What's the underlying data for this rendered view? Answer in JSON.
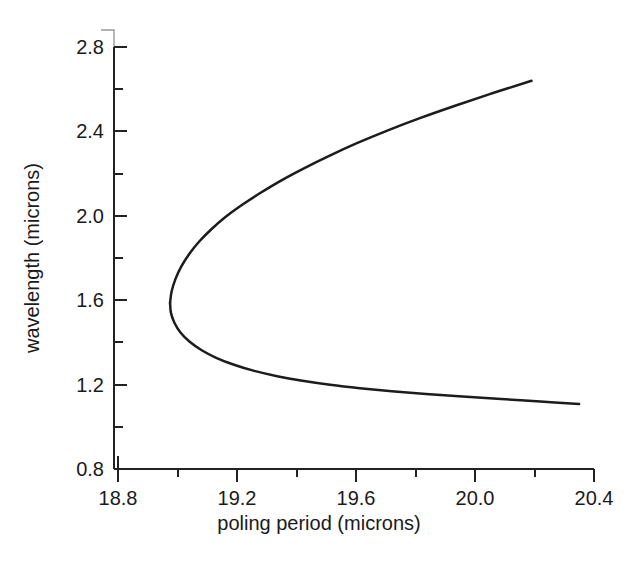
{
  "chart_data": {
    "type": "line",
    "title": "",
    "subtitle": "",
    "xlabel": "poling period (microns)",
    "ylabel": "wavelength (microns)",
    "xlim": [
      18.8,
      20.4
    ],
    "ylim": [
      0.8,
      2.8
    ],
    "xticks": [
      "18.8",
      "19.2",
      "19.6",
      "20.0",
      "20.4"
    ],
    "xtick_values": [
      18.8,
      19.2,
      19.6,
      20.0,
      20.4
    ],
    "xminor_step": 0.2,
    "yticks": [
      "2.8",
      "2.4",
      "2.0",
      "1.6",
      "1.2",
      "0.8"
    ],
    "ytick_values": [
      2.8,
      2.4,
      2.0,
      1.6,
      1.2,
      0.8
    ],
    "yminor_step": 0.2,
    "grid": false,
    "legend": "none",
    "tick_direction": "in",
    "axes_visible": [
      "left",
      "bottom"
    ],
    "line_color": "#1c1c1c",
    "background_color": "#ffffff",
    "series": [
      {
        "name": "signal branch (upper)",
        "comment": "upper branch: wavelength increases with poling period",
        "points": [
          [
            18.975,
            1.587
          ],
          [
            18.98,
            1.64
          ],
          [
            18.993,
            1.7
          ],
          [
            19.013,
            1.76
          ],
          [
            19.04,
            1.82
          ],
          [
            19.073,
            1.878
          ],
          [
            19.113,
            1.935
          ],
          [
            19.16,
            1.993
          ],
          [
            19.215,
            2.05
          ],
          [
            19.278,
            2.108
          ],
          [
            19.348,
            2.167
          ],
          [
            19.425,
            2.225
          ],
          [
            19.51,
            2.284
          ],
          [
            19.603,
            2.344
          ],
          [
            19.705,
            2.404
          ],
          [
            19.817,
            2.464
          ],
          [
            19.938,
            2.524
          ],
          [
            20.063,
            2.583
          ],
          [
            20.19,
            2.64
          ]
        ]
      },
      {
        "name": "idler branch (lower)",
        "comment": "lower branch: wavelength decreases with poling period",
        "points": [
          [
            18.975,
            1.587
          ],
          [
            18.978,
            1.54
          ],
          [
            18.99,
            1.492
          ],
          [
            19.01,
            1.447
          ],
          [
            19.04,
            1.404
          ],
          [
            19.08,
            1.364
          ],
          [
            19.13,
            1.327
          ],
          [
            19.19,
            1.294
          ],
          [
            19.258,
            1.265
          ],
          [
            19.335,
            1.24
          ],
          [
            19.42,
            1.218
          ],
          [
            19.513,
            1.199
          ],
          [
            19.613,
            1.183
          ],
          [
            19.72,
            1.169
          ],
          [
            19.835,
            1.156
          ],
          [
            19.958,
            1.144
          ],
          [
            20.088,
            1.132
          ],
          [
            20.22,
            1.12
          ],
          [
            20.35,
            1.108
          ]
        ]
      }
    ],
    "turning_point": {
      "x": 18.975,
      "y": 1.587,
      "label": "degeneracy / turning point"
    }
  },
  "axis_labels": {
    "x_title": "poling period (microns)",
    "y_title": "wavelength (microns)"
  },
  "x_tick_labels": [
    {
      "text": "18.8"
    },
    {
      "text": "19.2"
    },
    {
      "text": "19.6"
    },
    {
      "text": "20.0"
    },
    {
      "text": "20.4"
    }
  ],
  "y_tick_labels": [
    {
      "text": "2.8"
    },
    {
      "text": "2.4"
    },
    {
      "text": "2.0"
    },
    {
      "text": "1.6"
    },
    {
      "text": "1.2"
    },
    {
      "text": "0.8"
    }
  ]
}
